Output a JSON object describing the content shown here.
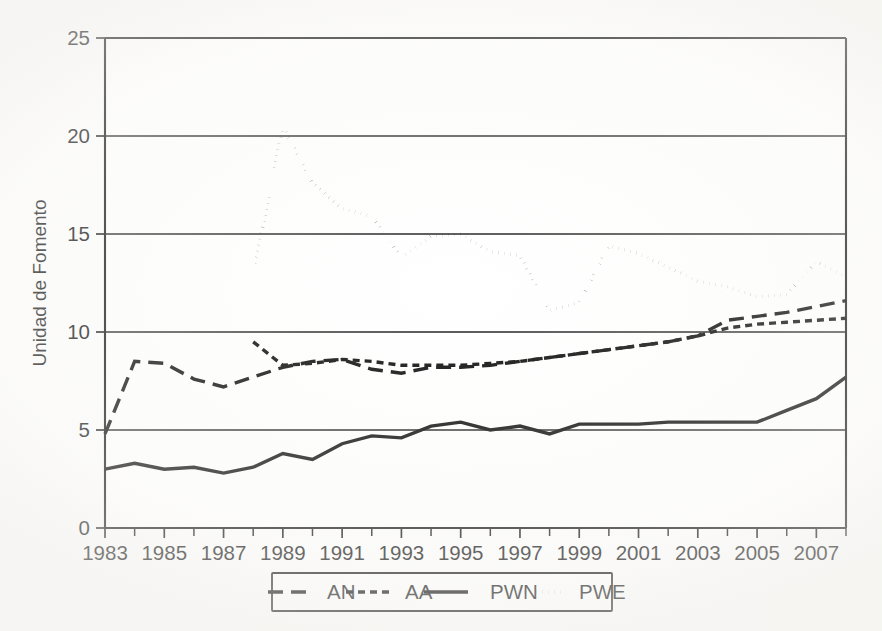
{
  "figure": {
    "background_color": "#fdfdfc",
    "ink_color": "#111111"
  },
  "chart_data": {
    "type": "line",
    "title": "",
    "xlabel": "",
    "ylabel": "Unidad de Fomento",
    "xlim": [
      1983,
      2008
    ],
    "ylim": [
      0,
      25
    ],
    "yticks": [
      0,
      5,
      10,
      15,
      20,
      25
    ],
    "ytick_labels": [
      "0",
      "5",
      "10",
      "15",
      "20",
      "25"
    ],
    "xticks": [
      1983,
      1984,
      1985,
      1986,
      1987,
      1988,
      1989,
      1990,
      1991,
      1992,
      1993,
      1994,
      1995,
      1996,
      1997,
      1998,
      1999,
      2000,
      2001,
      2002,
      2003,
      2004,
      2005,
      2006,
      2007,
      2008
    ],
    "xtick_labels_shown": [
      "1983",
      "1985",
      "1987",
      "1989",
      "1991",
      "1993",
      "1995",
      "1997",
      "1999",
      "2001",
      "2003",
      "2005",
      "2007"
    ],
    "grid": "horizontal-only",
    "legend_position": "below-center",
    "x": [
      1983,
      1984,
      1985,
      1986,
      1987,
      1988,
      1989,
      1990,
      1991,
      1992,
      1993,
      1994,
      1995,
      1996,
      1997,
      1998,
      1999,
      2000,
      2001,
      2002,
      2003,
      2004,
      2005,
      2006,
      2007,
      2008
    ],
    "series": [
      {
        "name": "AN",
        "style": "long-dash",
        "x": [
          1983,
          1984,
          1985,
          1986,
          1987,
          1988,
          1989,
          1990,
          1991,
          1992,
          1993,
          1994,
          1995,
          1996,
          1997,
          1998,
          1999,
          2000,
          2001,
          2002,
          2003,
          2004,
          2005,
          2006,
          2007,
          2008
        ],
        "values": [
          4.8,
          8.5,
          8.4,
          7.6,
          7.2,
          7.7,
          8.2,
          8.5,
          8.6,
          8.1,
          7.9,
          8.2,
          8.2,
          8.3,
          8.5,
          8.7,
          8.9,
          9.1,
          9.3,
          9.5,
          9.8,
          10.6,
          10.8,
          11.0,
          11.3,
          11.6
        ]
      },
      {
        "name": "AA",
        "style": "short-dash",
        "x": [
          1988,
          1989,
          1990,
          1991,
          1992,
          1993,
          1994,
          1995,
          1996,
          1997,
          1998,
          1999,
          2000,
          2001,
          2002,
          2003,
          2004,
          2005,
          2006,
          2007,
          2008
        ],
        "values": [
          9.5,
          8.3,
          8.4,
          8.6,
          8.5,
          8.3,
          8.3,
          8.3,
          8.4,
          8.5,
          8.7,
          8.9,
          9.1,
          9.3,
          9.5,
          9.8,
          10.2,
          10.4,
          10.5,
          10.6,
          10.7
        ]
      },
      {
        "name": "PWN",
        "style": "solid",
        "x": [
          1983,
          1984,
          1985,
          1986,
          1987,
          1988,
          1989,
          1990,
          1991,
          1992,
          1993,
          1994,
          1995,
          1996,
          1997,
          1998,
          1999,
          2000,
          2001,
          2002,
          2003,
          2004,
          2005,
          2006,
          2007,
          2008
        ],
        "values": [
          3.0,
          3.3,
          3.0,
          3.1,
          2.8,
          3.1,
          3.8,
          3.5,
          4.3,
          4.7,
          4.6,
          5.2,
          5.4,
          5.0,
          5.2,
          4.8,
          5.3,
          5.3,
          5.3,
          5.4,
          5.4,
          5.4,
          5.4,
          6.0,
          6.6,
          7.7
        ]
      },
      {
        "name": "PWE",
        "style": "dotted",
        "x": [
          1988,
          1989,
          1990,
          1991,
          1992,
          1993,
          1994,
          1995,
          1996,
          1997,
          1998,
          1999,
          2000,
          2001,
          2002,
          2003,
          2004,
          2005,
          2006,
          2007,
          2008
        ],
        "values": [
          12.9,
          20.5,
          17.6,
          16.3,
          15.9,
          13.8,
          14.9,
          15.0,
          14.1,
          13.9,
          11.1,
          11.5,
          14.4,
          14.0,
          13.3,
          12.6,
          12.3,
          11.8,
          11.9,
          13.6,
          12.8
        ]
      }
    ],
    "legend": [
      {
        "label": "AN",
        "style": "long-dash"
      },
      {
        "label": "AA",
        "style": "short-dash"
      },
      {
        "label": "PWN",
        "style": "solid"
      },
      {
        "label": "PWE",
        "style": "dotted"
      }
    ]
  }
}
